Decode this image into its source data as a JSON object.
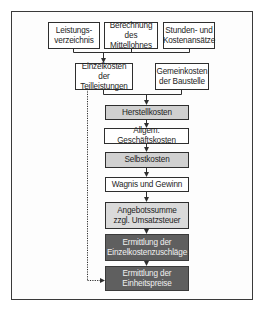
{
  "diagram": {
    "colors": {
      "border": "#2e2e2e",
      "fill_white": "#ffffff",
      "fill_light_gray": "#d0d0d0",
      "fill_lighter_gray": "#dadada",
      "fill_dark_gray": "#5f5f5f",
      "dark_text": "#f0f0f0"
    },
    "inputs": [
      {
        "label": "Leistungs-\nverzeichnis"
      },
      {
        "label": "Berechnung des\nMittellohnes"
      },
      {
        "label": "Stunden- und\nKostenansätze"
      }
    ],
    "second_row": [
      {
        "label": "Einzelkosten der\nTeilleistungen"
      },
      {
        "label": "Gemeinkosten\nder Baustelle"
      }
    ],
    "flow": [
      {
        "label": "Herstellkosten",
        "style": "light"
      },
      {
        "label": "Allgem. Geschäftskosten",
        "style": "white"
      },
      {
        "label": "Selbstkosten",
        "style": "light"
      },
      {
        "label": "Wagnis und Gewinn",
        "style": "white"
      },
      {
        "label": "Angebotssumme\nzzgl. Umsatzsteuer",
        "style": "lighter"
      },
      {
        "label": "Ermittlung der\nEinzelkostenzuschläge",
        "style": "dark"
      },
      {
        "label": "Ermittlung der\nEinheitspreise",
        "style": "dark"
      }
    ]
  }
}
